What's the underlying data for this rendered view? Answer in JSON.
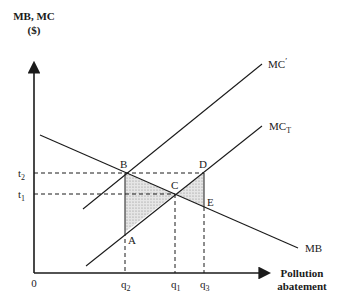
{
  "axes": {
    "y_label_line1": "MB, MC",
    "y_label_line2": "($)",
    "x_label_line1": "Pollution",
    "x_label_line2": "abatement",
    "origin": "0"
  },
  "y_ticks": {
    "t2": {
      "base": "t",
      "sub": "2"
    },
    "t1": {
      "base": "t",
      "sub": "1"
    }
  },
  "x_ticks": {
    "q2": {
      "base": "q",
      "sub": "2"
    },
    "q1": {
      "base": "q",
      "sub": "1"
    },
    "q3": {
      "base": "q",
      "sub": "3"
    }
  },
  "curves": {
    "mc_prime": {
      "label": "MC",
      "suffix": "′"
    },
    "mc_t": {
      "label": "MC",
      "sub": "T"
    },
    "mb": {
      "label": "MB"
    }
  },
  "points": {
    "A": "A",
    "B": "B",
    "C": "C",
    "D": "D",
    "E": "E"
  },
  "colors": {
    "line": "#1a1a1a",
    "shade": "#d9d9d9"
  }
}
